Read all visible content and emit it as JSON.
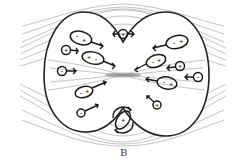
{
  "figure": {
    "caption": "B",
    "colors": {
      "outline": "#222222",
      "field_lines": "#9a9a9a",
      "particles": "#1a1a1a",
      "background": "#ffffff"
    },
    "particles": [
      {
        "id": "left-1",
        "shape": "ellipse",
        "signs": [
          "-",
          "+"
        ],
        "direction": "right"
      },
      {
        "id": "left-2",
        "shape": "circle",
        "signs": [
          "+"
        ],
        "direction": "right"
      },
      {
        "id": "left-3",
        "shape": "ellipse",
        "signs": [
          "+",
          "-"
        ],
        "direction": "right"
      },
      {
        "id": "left-4",
        "shape": "circle",
        "signs": [
          "-"
        ],
        "direction": "right"
      },
      {
        "id": "left-5",
        "shape": "ellipse",
        "signs": [
          "-",
          "+"
        ],
        "direction": "right"
      },
      {
        "id": "left-6",
        "shape": "circle",
        "signs": [
          "-"
        ],
        "direction": "right"
      },
      {
        "id": "top-center",
        "shape": "circle",
        "signs": [
          "+"
        ],
        "direction": "both"
      },
      {
        "id": "right-1",
        "shape": "ellipse",
        "signs": [
          "-",
          "+"
        ],
        "direction": "left"
      },
      {
        "id": "right-2",
        "shape": "ellipse",
        "signs": [
          "-",
          "+"
        ],
        "direction": "left"
      },
      {
        "id": "right-3",
        "shape": "circle",
        "signs": [
          "+"
        ],
        "direction": "left"
      },
      {
        "id": "right-4",
        "shape": "circle",
        "signs": [
          "-"
        ],
        "direction": "left"
      },
      {
        "id": "right-5",
        "shape": "ellipse",
        "signs": [
          "-",
          "+"
        ],
        "direction": "left"
      },
      {
        "id": "right-6",
        "shape": "circle",
        "signs": [
          "+"
        ],
        "direction": "up-left"
      },
      {
        "id": "bottom-center",
        "shape": "ellipse",
        "signs": [
          "+"
        ],
        "direction": "rotating"
      }
    ]
  }
}
